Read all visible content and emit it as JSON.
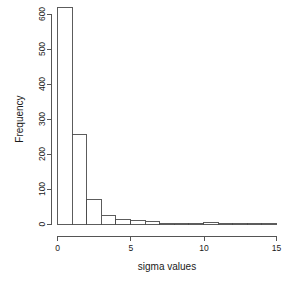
{
  "chart_data": {
    "type": "bar",
    "subtype": "histogram",
    "title": "",
    "xlabel": "sigma values",
    "ylabel": "Frequency",
    "xlim": [
      0,
      15
    ],
    "ylim": [
      0,
      620
    ],
    "grid": false,
    "legend": null,
    "bin_width": 1,
    "xticks": [
      0,
      5,
      10,
      15
    ],
    "xtick_labels": [
      "0",
      "5",
      "10",
      "15"
    ],
    "yticks": [
      0,
      100,
      200,
      300,
      400,
      500,
      600
    ],
    "ytick_labels": [
      "0",
      "100",
      "200",
      "300",
      "400",
      "500",
      "600"
    ],
    "bin_edges": [
      0,
      1,
      2,
      3,
      4,
      5,
      6,
      7,
      8,
      9,
      10,
      11,
      12,
      13,
      14,
      15
    ],
    "categories": [
      "0-1",
      "1-2",
      "2-3",
      "3-4",
      "4-5",
      "5-6",
      "6-7",
      "7-8",
      "8-9",
      "9-10",
      "10-11",
      "11-12",
      "12-13",
      "13-14",
      "14-15"
    ],
    "values": [
      620,
      255,
      70,
      25,
      14,
      9,
      8,
      2,
      2,
      1,
      3,
      2,
      1,
      1,
      2
    ]
  },
  "colors": {
    "background": "#ffffff",
    "axis": "#555555",
    "bar_stroke": "#4a4a4a",
    "bar_fill": "#ffffff",
    "text": "#1a1a1a"
  }
}
